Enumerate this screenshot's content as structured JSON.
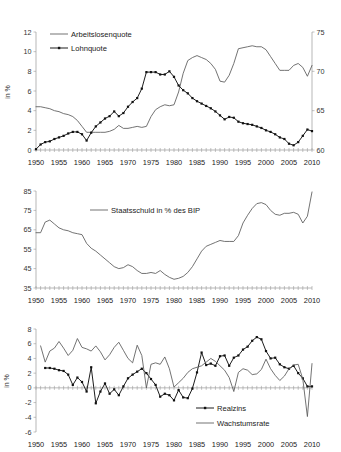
{
  "figure": {
    "axis_label_left": "in %",
    "x_ticks": [
      "1950",
      "1955",
      "1960",
      "1965",
      "1970",
      "1975",
      "1980",
      "1985",
      "1990",
      "1995",
      "2000",
      "2005",
      "2010"
    ]
  },
  "chart_data": [
    {
      "type": "line",
      "title": "",
      "xlabel": "",
      "ylabel": "in %",
      "y2label": "",
      "xlim": [
        1950,
        2010
      ],
      "ylim": [
        0,
        12
      ],
      "y2lim": [
        60,
        75
      ],
      "yticks": [
        "0",
        "2",
        "4",
        "6",
        "8",
        "10",
        "12"
      ],
      "y2ticks": [
        "60",
        "65",
        "70",
        "75"
      ],
      "grid": false,
      "legend_position": "top-left",
      "x": [
        1950,
        1951,
        1952,
        1953,
        1954,
        1955,
        1956,
        1957,
        1958,
        1959,
        1960,
        1961,
        1962,
        1963,
        1964,
        1965,
        1966,
        1967,
        1968,
        1969,
        1970,
        1971,
        1972,
        1973,
        1974,
        1975,
        1976,
        1977,
        1978,
        1979,
        1980,
        1981,
        1982,
        1983,
        1984,
        1985,
        1986,
        1987,
        1988,
        1989,
        1990,
        1991,
        1992,
        1993,
        1994,
        1995,
        1996,
        1997,
        1998,
        1999,
        2000,
        2001,
        2002,
        2003,
        2004,
        2005,
        2006,
        2007,
        2008,
        2009,
        2010
      ],
      "series": [
        {
          "name": "Arbeitslosenquote",
          "axis": "left",
          "marker": false,
          "values": [
            4.4,
            4.4,
            4.3,
            4.2,
            4.0,
            3.9,
            3.7,
            3.6,
            3.4,
            3.0,
            2.4,
            1.8,
            1.8,
            1.8,
            1.8,
            1.8,
            1.9,
            2.1,
            2.5,
            2.2,
            2.2,
            2.3,
            2.4,
            2.3,
            2.4,
            3.4,
            4.1,
            4.4,
            4.6,
            4.5,
            4.6,
            5.9,
            7.8,
            9.1,
            9.4,
            9.6,
            9.4,
            9.2,
            8.8,
            8.2,
            7.0,
            6.9,
            7.6,
            8.8,
            10.3,
            10.4,
            10.5,
            10.6,
            10.5,
            10.5,
            10.2,
            9.5,
            8.8,
            8.1,
            8.1,
            8.1,
            8.6,
            8.8,
            8.4,
            7.5,
            8.6,
            10.7
          ],
          "color": "#5a5a5a"
        },
        {
          "name": "Lohnquote",
          "axis": "right",
          "marker": true,
          "values_axis2": [
            60.1,
            60.7,
            61.0,
            61.1,
            61.4,
            61.6,
            61.8,
            62.1,
            62.3,
            62.3,
            62.0,
            61.2,
            62.2,
            63.0,
            63.5,
            64.0,
            64.3,
            64.9,
            64.3,
            64.7,
            65.5,
            66.1,
            66.6,
            67.8,
            69.9,
            69.9,
            69.9,
            69.6,
            69.6,
            70.0,
            69.3,
            68.2,
            67.6,
            67.2,
            66.6,
            66.2,
            65.9,
            65.6,
            65.3,
            64.9,
            64.4,
            63.9,
            64.2,
            64.1,
            63.6,
            63.4,
            63.3,
            63.2,
            63.0,
            62.8,
            62.5,
            62.3,
            62.0,
            61.6,
            61.4,
            60.8,
            60.6,
            61.0,
            61.8,
            62.6,
            62.4
          ],
          "color": "#111111"
        }
      ]
    },
    {
      "type": "line",
      "title": "",
      "xlabel": "",
      "ylabel": "",
      "xlim": [
        1950,
        2010
      ],
      "ylim": [
        35,
        85
      ],
      "yticks": [
        "35",
        "45",
        "55",
        "65",
        "75",
        "85"
      ],
      "grid": false,
      "legend_position": "top-center",
      "series": [
        {
          "name": "Staatsschuld in % des BIP",
          "marker": false,
          "values": [
            63.5,
            63.5,
            69.0,
            70.0,
            68.0,
            66.0,
            65.0,
            64.5,
            63.5,
            63.0,
            62.5,
            58.0,
            55.5,
            54.0,
            52.0,
            50.0,
            48.0,
            46.0,
            45.0,
            45.5,
            47.0,
            46.0,
            44.0,
            42.5,
            42.5,
            43.0,
            42.5,
            44.0,
            42.0,
            40.5,
            39.5,
            40.0,
            41.0,
            43.0,
            46.0,
            50.0,
            54.0,
            56.5,
            57.5,
            58.5,
            59.5,
            59.0,
            59.0,
            59.0,
            62.0,
            68.5,
            72.5,
            76.0,
            78.5,
            79.0,
            78.0,
            75.0,
            73.0,
            72.5,
            73.5,
            73.5,
            74.0,
            73.0,
            68.5,
            72.0,
            84.5
          ],
          "color": "#5a5a5a"
        }
      ]
    },
    {
      "type": "line",
      "title": "",
      "xlabel": "",
      "ylabel": "in %",
      "xlim": [
        1950,
        2010
      ],
      "ylim": [
        -6,
        8
      ],
      "yticks": [
        "-6",
        "-4",
        "-2",
        "0",
        "2",
        "4",
        "6",
        "8"
      ],
      "grid": false,
      "legend_position": "bottom-center",
      "series": [
        {
          "name": "Realzins",
          "marker": true,
          "values": [
            null,
            null,
            2.7,
            2.7,
            2.6,
            2.4,
            2.3,
            1.8,
            0.4,
            1.4,
            0.8,
            -0.5,
            2.8,
            -2.1,
            -0.5,
            0.6,
            -0.8,
            -0.2,
            -1.0,
            0.2,
            1.3,
            1.8,
            2.2,
            2.6,
            2.0,
            1.2,
            0.4,
            -1.2,
            -0.8,
            -1.0,
            -1.7,
            -0.3,
            -1.3,
            -1.4,
            -0.1,
            2.1,
            4.8,
            3.1,
            3.3,
            3.0,
            4.3,
            4.4,
            3.0,
            4.1,
            4.4,
            5.2,
            5.6,
            6.4,
            6.9,
            6.6,
            5.0,
            4.0,
            4.1,
            3.2,
            2.8,
            2.6,
            3.0,
            2.0,
            1.3,
            0.2,
            0.2,
            0.2,
            0.3,
            1.3,
            2.5,
            0.3,
            0.3
          ],
          "color": "#111111"
        },
        {
          "name": "Wachstumsrate",
          "marker": false,
          "values": [
            null,
            5.7,
            3.5,
            5.0,
            5.4,
            6.3,
            5.4,
            4.4,
            5.1,
            6.7,
            5.5,
            5.3,
            5.0,
            5.7,
            4.9,
            3.8,
            4.5,
            5.5,
            6.2,
            5.1,
            4.0,
            3.4,
            5.8,
            4.4,
            0.0,
            3.2,
            3.4,
            3.2,
            4.2,
            2.6,
            0.1,
            0.7,
            1.3,
            2.1,
            2.6,
            2.8,
            3.0,
            3.5,
            4.0,
            3.6,
            3.0,
            2.4,
            1.4,
            -0.5,
            2.1,
            2.6,
            2.4,
            1.8,
            1.9,
            2.5,
            3.9,
            2.6,
            1.7,
            1.0,
            1.6,
            2.6,
            3.1,
            3.2,
            1.2,
            -3.9,
            3.3
          ],
          "color": "#5a5a5a"
        }
      ]
    }
  ]
}
